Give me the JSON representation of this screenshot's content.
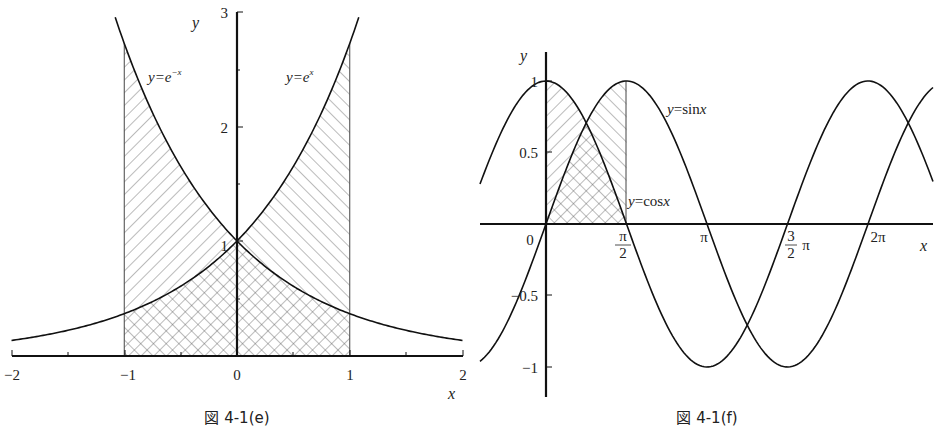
{
  "chart_data": [
    {
      "type": "line",
      "title": "図 4-1(e)",
      "caption": "図 4-1(e)",
      "xlabel": "x",
      "ylabel": "y",
      "xlim": [
        -2,
        2
      ],
      "ylim": [
        0,
        3
      ],
      "x_ticks": [
        -2,
        -1,
        0,
        1,
        2
      ],
      "x_tick_labels": [
        "−2",
        "−1",
        "0",
        "1",
        "2"
      ],
      "y_ticks": [
        1,
        2,
        3
      ],
      "y_tick_labels": [
        "1",
        "2",
        "3"
      ],
      "series": [
        {
          "name": "y=e^{-x}",
          "label": "y=e",
          "label_sup": "−x",
          "function": "exp(-x)",
          "x": [
            -2,
            -1.5,
            -1,
            -0.5,
            0,
            0.5,
            1,
            1.5,
            2
          ],
          "values": [
            7.389,
            4.482,
            2.718,
            1.649,
            1.0,
            0.607,
            0.368,
            0.223,
            0.135
          ]
        },
        {
          "name": "y=e^{x}",
          "label": "y=e",
          "label_sup": "x",
          "function": "exp(x)",
          "x": [
            -2,
            -1.5,
            -1,
            -0.5,
            0,
            0.5,
            1,
            1.5,
            2
          ],
          "values": [
            0.135,
            0.223,
            0.368,
            0.607,
            1.0,
            1.649,
            2.718,
            4.482,
            7.389
          ]
        }
      ],
      "shaded_regions": [
        {
          "description": "under y=e^{-x}, x from -1 to 0 (single hatch)",
          "x_range": [
            -1,
            0
          ]
        },
        {
          "description": "under y=e^{x}, x from 0 to 1 (single hatch)",
          "x_range": [
            0,
            1
          ]
        },
        {
          "description": "under min(e^x, e^{-x}), x from -1 to 1 (cross hatch)",
          "x_range": [
            -1,
            1
          ]
        }
      ],
      "grid": false,
      "legend": "none (inline curve labels)"
    },
    {
      "type": "line",
      "title": "図 4-1(f)",
      "caption": "図 4-1(f)",
      "xlabel": "x",
      "ylabel": "y",
      "xlim": [
        -1.28,
        7.53
      ],
      "ylim": [
        -1.2,
        1.2
      ],
      "x_ticks": [
        1.5708,
        3.1416,
        4.7124,
        6.2832
      ],
      "x_tick_labels": [
        "π/2",
        "π",
        "3/2π",
        "2π"
      ],
      "origin_label": "0",
      "y_ticks": [
        -1,
        -0.5,
        0.5,
        1
      ],
      "y_tick_labels": [
        "−1",
        "−0.5",
        "0.5",
        "1"
      ],
      "series": [
        {
          "name": "y=sin x",
          "label": "y=sin x",
          "function": "sin(x)",
          "x": [
            0,
            0.7854,
            1.5708,
            3.1416,
            4.7124,
            6.2832
          ],
          "values": [
            0,
            0.707,
            1,
            0,
            -1,
            0
          ]
        },
        {
          "name": "y=cos x",
          "label": "y=cos x",
          "function": "cos(x)",
          "x": [
            0,
            0.7854,
            1.5708,
            3.1416,
            4.7124,
            6.2832
          ],
          "values": [
            1,
            0.707,
            0,
            -1,
            0,
            1
          ]
        }
      ],
      "shaded_regions": [
        {
          "description": "under cos x, x from 0 to π/2 (single hatch /)",
          "x_range": [
            0,
            1.5708
          ]
        },
        {
          "description": "under sin x, x from 0 to π/2 (single hatch \\)",
          "x_range": [
            0,
            1.5708
          ]
        },
        {
          "description": "under min(sin x, cos x), x from 0 to π/2 (cross hatch)",
          "x_range": [
            0,
            1.5708
          ]
        }
      ],
      "grid": false,
      "legend": "none (inline curve labels)"
    }
  ],
  "figures": {
    "left": {
      "caption": "図 4-1(e)",
      "x_axis_label": "x",
      "y_axis_label": "y",
      "x_tick_labels": [
        "−2",
        "−1",
        "0",
        "1",
        "2"
      ],
      "y_tick_labels": [
        "1",
        "2",
        "3"
      ],
      "curve_label_left": {
        "base": "y=e",
        "sup": "−x"
      },
      "curve_label_right": {
        "base": "y=e",
        "sup": "x"
      }
    },
    "right": {
      "caption": "図 4-1(f)",
      "x_axis_label": "x",
      "y_axis_label": "y",
      "origin_label": "0",
      "y_tick_labels": {
        "one": "1",
        "half": "0.5",
        "neg_half": "−0.5",
        "neg_one": "−1"
      },
      "x_tick_labels": {
        "pi_half_num": "π",
        "pi_half_den": "2",
        "pi": "π",
        "three_half_num": "3",
        "three_half_den": "2",
        "three_half_pi": "π",
        "two_pi": "2π"
      },
      "sin_label": {
        "y": "y",
        "eq": "=sin",
        "x": "x"
      },
      "cos_label": {
        "y": "y",
        "eq": "=cos",
        "x": "x"
      }
    }
  }
}
